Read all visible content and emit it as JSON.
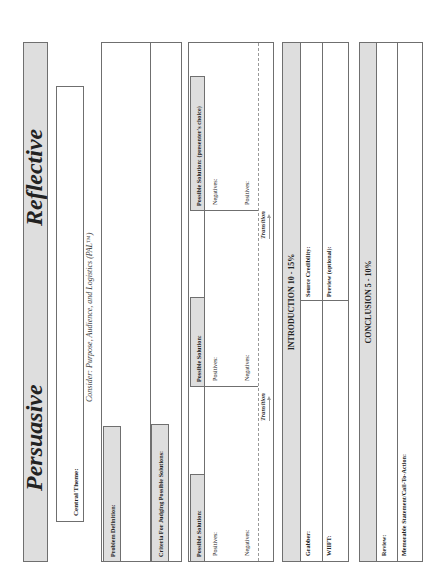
{
  "header": {
    "left_title": "Persuasive",
    "right_title": "Reflective"
  },
  "central_theme": {
    "label": "Central Theme:",
    "consider": "Consider:  Purpose, Audience, and Logistics (PAL™)"
  },
  "problem": {
    "definition_label": "Problem Definition:",
    "criteria_label": "Criteria For Judging Possible Solutions:"
  },
  "solutions": [
    {
      "title": "Possible Solution:",
      "first": "Positives:",
      "second": "Negatives:"
    },
    {
      "title": "Possible Solution:",
      "first": "Positives:",
      "second": "Negatives:"
    },
    {
      "title": "Possible Solution:  (presenter's choice)",
      "first": "Negatives:",
      "second": "Positives:"
    }
  ],
  "transition_label": "Transition",
  "introduction": {
    "header": "INTRODUCTION 10 - 15%",
    "grabber": "Grabber:",
    "source_credibility": "Source Credibility:",
    "wiifm": "WIIFT:",
    "preview": "Preview (optional):"
  },
  "conclusion": {
    "header": "CONCLUSION 5 - 10%",
    "review": "Review:",
    "memorable": "Memorable Statement/Call-To-Action:"
  },
  "colors": {
    "shade": "#dedede",
    "border": "#6f6f6f"
  }
}
